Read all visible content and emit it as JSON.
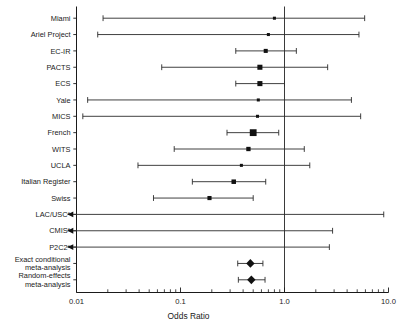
{
  "chart_data": {
    "type": "forest",
    "title": "",
    "xlabel": "Odds Ratio",
    "ylabel": "",
    "xscale": "log",
    "xlim": [
      0.01,
      10.0
    ],
    "xticks": [
      0.01,
      0.1,
      1.0,
      10.0
    ],
    "xticklabels": [
      "0.01",
      "0.1",
      "1.0",
      "10.0"
    ],
    "reference_line": 1.0,
    "grid": false,
    "legend": "none",
    "footnote_marker": "*",
    "categories": [
      "Miami",
      "Ariel Project",
      "EC-IR",
      "PACTS",
      "ECS",
      "Yale",
      "MICS",
      "French",
      "WITS",
      "UCLA",
      "Italian Register",
      "Swiss",
      "LAC/USC*",
      "CMIS*",
      "P2C2*",
      "Exact conditional meta-analysis",
      "Random-effects meta-analysis"
    ],
    "studies": [
      {
        "label": "Miami",
        "label_lines": [
          "Miami"
        ],
        "or": 0.8,
        "lo": 0.018,
        "hi": 5.9,
        "weight": 0.18,
        "marker": "square",
        "arrow_left": false
      },
      {
        "label": "Ariel Project",
        "label_lines": [
          "Ariel Project"
        ],
        "or": 0.7,
        "lo": 0.016,
        "hi": 5.2,
        "weight": 0.18,
        "marker": "square",
        "arrow_left": false
      },
      {
        "label": "EC-IR",
        "label_lines": [
          "EC-IR"
        ],
        "or": 0.66,
        "lo": 0.34,
        "hi": 1.3,
        "weight": 0.4,
        "marker": "square",
        "arrow_left": false
      },
      {
        "label": "PACTS",
        "label_lines": [
          "PACTS"
        ],
        "or": 0.58,
        "lo": 0.066,
        "hi": 2.6,
        "weight": 0.62,
        "marker": "square",
        "arrow_left": false
      },
      {
        "label": "ECS",
        "label_lines": [
          "ECS"
        ],
        "or": 0.58,
        "lo": 0.34,
        "hi": 1.0,
        "weight": 0.62,
        "marker": "square",
        "arrow_left": false
      },
      {
        "label": "Yale",
        "label_lines": [
          "Yale"
        ],
        "or": 0.56,
        "lo": 0.0128,
        "hi": 4.4,
        "weight": 0.18,
        "marker": "square",
        "arrow_left": false
      },
      {
        "label": "MICS",
        "label_lines": [
          "MICS"
        ],
        "or": 0.55,
        "lo": 0.0115,
        "hi": 5.4,
        "weight": 0.18,
        "marker": "square",
        "arrow_left": false
      },
      {
        "label": "French",
        "label_lines": [
          "French"
        ],
        "or": 0.5,
        "lo": 0.28,
        "hi": 0.88,
        "weight": 1.0,
        "marker": "square",
        "arrow_left": false
      },
      {
        "label": "WITS",
        "label_lines": [
          "WITS"
        ],
        "or": 0.45,
        "lo": 0.087,
        "hi": 1.55,
        "weight": 0.46,
        "marker": "square",
        "arrow_left": false
      },
      {
        "label": "UCLA",
        "label_lines": [
          "UCLA"
        ],
        "or": 0.385,
        "lo": 0.039,
        "hi": 1.75,
        "weight": 0.18,
        "marker": "square",
        "arrow_left": false
      },
      {
        "label": "Italian Register",
        "label_lines": [
          "Italian Register"
        ],
        "or": 0.325,
        "lo": 0.13,
        "hi": 0.66,
        "weight": 0.5,
        "marker": "square",
        "arrow_left": false
      },
      {
        "label": "Swiss",
        "label_lines": [
          "Swiss"
        ],
        "or": 0.19,
        "lo": 0.055,
        "hi": 0.5,
        "weight": 0.42,
        "marker": "square",
        "arrow_left": false
      },
      {
        "label": "LAC/USC*",
        "label_lines": [
          "LAC/USC*"
        ],
        "or": null,
        "lo": 0.0,
        "hi": 9.0,
        "weight": 0,
        "marker": "none",
        "arrow_left": true
      },
      {
        "label": "CMIS*",
        "label_lines": [
          "CMIS*"
        ],
        "or": null,
        "lo": 0.0,
        "hi": 2.9,
        "weight": 0,
        "marker": "none",
        "arrow_left": true
      },
      {
        "label": "P2C2*",
        "label_lines": [
          "P2C2*"
        ],
        "or": null,
        "lo": 0.0,
        "hi": 2.7,
        "weight": 0,
        "marker": "none",
        "arrow_left": true
      }
    ],
    "summaries": [
      {
        "label": "Exact conditional meta-analysis",
        "label_lines": [
          "Exact conditional",
          "meta-analysis"
        ],
        "or": 0.47,
        "lo": 0.355,
        "hi": 0.62,
        "marker": "diamond"
      },
      {
        "label": "Random-effects meta-analysis",
        "label_lines": [
          "Random-effects",
          "meta-analysis"
        ],
        "or": 0.48,
        "lo": 0.36,
        "hi": 0.65,
        "marker": "diamond"
      }
    ],
    "colors": {
      "marker": "#111111",
      "line": "#2b2b2b",
      "axis": "#1a1a1a",
      "reference": "#3a3a3a",
      "background": "#ffffff"
    }
  }
}
